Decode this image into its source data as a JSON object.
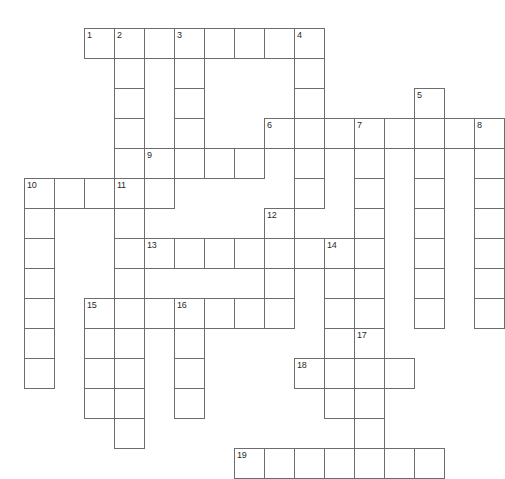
{
  "puzzle": {
    "kind": "crossword-grid",
    "title": "",
    "columns": 16,
    "rows": 15,
    "cell_size_px": 30,
    "origin_x_px": 24,
    "origin_y_px": 28,
    "cell_fill_color": "#ffffff",
    "cell_border_color": "#6d6d6d",
    "number_color": "#2a2a2a",
    "background_color": "#ffffff",
    "total_cells": 128,
    "total_numbers": 19,
    "entries_across": [
      {
        "number": "1",
        "row": 0,
        "col": 2,
        "length": 8
      },
      {
        "number": "6",
        "row": 3,
        "col": 8,
        "length": 7
      },
      {
        "number": "9",
        "row": 4,
        "col": 4,
        "length": 4
      },
      {
        "number": "10",
        "row": 5,
        "col": 0,
        "length": 5
      },
      {
        "number": "13",
        "row": 7,
        "col": 4,
        "length": 6
      },
      {
        "number": "15",
        "row": 9,
        "col": 2,
        "length": 6
      },
      {
        "number": "18",
        "row": 11,
        "col": 9,
        "length": 4
      },
      {
        "number": "19",
        "row": 14,
        "col": 7,
        "length": 7
      }
    ],
    "entries_down": [
      {
        "number": "2",
        "row": 0,
        "col": 3,
        "length": 5
      },
      {
        "number": "3",
        "row": 0,
        "col": 5,
        "length": 5
      },
      {
        "number": "4",
        "row": 0,
        "col": 9,
        "length": 7
      },
      {
        "number": "5",
        "row": 2,
        "col": 13,
        "length": 7
      },
      {
        "number": "7",
        "row": 3,
        "col": 11,
        "length": 8
      },
      {
        "number": "8",
        "row": 3,
        "col": 15,
        "length": 6
      },
      {
        "number": "10",
        "row": 5,
        "col": 0,
        "length": 7
      },
      {
        "number": "11",
        "row": 5,
        "col": 3,
        "length": 8
      },
      {
        "number": "12",
        "row": 6,
        "col": 8,
        "length": 6
      },
      {
        "number": "14",
        "row": 7,
        "col": 10,
        "length": 7
      },
      {
        "number": "16",
        "row": 9,
        "col": 5,
        "length": 4
      },
      {
        "number": "17",
        "row": 10,
        "col": 11,
        "length": 6
      }
    ],
    "cells": [
      [
        0,
        2
      ],
      [
        0,
        3
      ],
      [
        0,
        4
      ],
      [
        0,
        5
      ],
      [
        0,
        6
      ],
      [
        0,
        7
      ],
      [
        0,
        8
      ],
      [
        0,
        9
      ],
      [
        1,
        3
      ],
      [
        1,
        5
      ],
      [
        1,
        9
      ],
      [
        2,
        3
      ],
      [
        2,
        5
      ],
      [
        2,
        9
      ],
      [
        2,
        13
      ],
      [
        3,
        3
      ],
      [
        3,
        5
      ],
      [
        3,
        8
      ],
      [
        3,
        9
      ],
      [
        3,
        10
      ],
      [
        3,
        11
      ],
      [
        3,
        12
      ],
      [
        3,
        13
      ],
      [
        3,
        14
      ],
      [
        3,
        15
      ],
      [
        4,
        3
      ],
      [
        4,
        4
      ],
      [
        4,
        5
      ],
      [
        4,
        6
      ],
      [
        4,
        7
      ],
      [
        4,
        9
      ],
      [
        4,
        11
      ],
      [
        4,
        13
      ],
      [
        4,
        15
      ],
      [
        5,
        0
      ],
      [
        5,
        1
      ],
      [
        5,
        2
      ],
      [
        5,
        3
      ],
      [
        5,
        4
      ],
      [
        5,
        9
      ],
      [
        5,
        11
      ],
      [
        5,
        13
      ],
      [
        5,
        15
      ],
      [
        6,
        0
      ],
      [
        6,
        3
      ],
      [
        6,
        8
      ],
      [
        6,
        11
      ],
      [
        6,
        13
      ],
      [
        6,
        15
      ],
      [
        7,
        0
      ],
      [
        7,
        3
      ],
      [
        7,
        4
      ],
      [
        7,
        5
      ],
      [
        7,
        6
      ],
      [
        7,
        7
      ],
      [
        7,
        8
      ],
      [
        7,
        9
      ],
      [
        7,
        10
      ],
      [
        7,
        11
      ],
      [
        7,
        13
      ],
      [
        7,
        15
      ],
      [
        8,
        0
      ],
      [
        8,
        3
      ],
      [
        8,
        8
      ],
      [
        8,
        10
      ],
      [
        8,
        11
      ],
      [
        8,
        13
      ],
      [
        8,
        15
      ],
      [
        9,
        0
      ],
      [
        9,
        2
      ],
      [
        9,
        3
      ],
      [
        9,
        4
      ],
      [
        9,
        5
      ],
      [
        9,
        6
      ],
      [
        9,
        7
      ],
      [
        9,
        8
      ],
      [
        9,
        10
      ],
      [
        9,
        11
      ],
      [
        9,
        13
      ],
      [
        9,
        15
      ],
      [
        10,
        0
      ],
      [
        10,
        2
      ],
      [
        10,
        3
      ],
      [
        10,
        5
      ],
      [
        10,
        10
      ],
      [
        10,
        11
      ],
      [
        11,
        0
      ],
      [
        11,
        2
      ],
      [
        11,
        3
      ],
      [
        11,
        5
      ],
      [
        11,
        9
      ],
      [
        11,
        10
      ],
      [
        11,
        11
      ],
      [
        11,
        12
      ],
      [
        12,
        2
      ],
      [
        12,
        3
      ],
      [
        12,
        5
      ],
      [
        12,
        10
      ],
      [
        12,
        11
      ],
      [
        13,
        3
      ],
      [
        13,
        11
      ],
      [
        14,
        7
      ],
      [
        14,
        8
      ],
      [
        14,
        9
      ],
      [
        14,
        10
      ],
      [
        14,
        11
      ],
      [
        14,
        12
      ],
      [
        14,
        13
      ]
    ],
    "numbered_cells": [
      {
        "label": "1",
        "row": 0,
        "col": 2
      },
      {
        "label": "2",
        "row": 0,
        "col": 3
      },
      {
        "label": "3",
        "row": 0,
        "col": 5
      },
      {
        "label": "4",
        "row": 0,
        "col": 9
      },
      {
        "label": "5",
        "row": 2,
        "col": 13
      },
      {
        "label": "6",
        "row": 3,
        "col": 8
      },
      {
        "label": "7",
        "row": 3,
        "col": 11
      },
      {
        "label": "8",
        "row": 3,
        "col": 15
      },
      {
        "label": "9",
        "row": 4,
        "col": 4
      },
      {
        "label": "10",
        "row": 5,
        "col": 0
      },
      {
        "label": "11",
        "row": 5,
        "col": 3
      },
      {
        "label": "12",
        "row": 6,
        "col": 8
      },
      {
        "label": "13",
        "row": 7,
        "col": 4
      },
      {
        "label": "14",
        "row": 7,
        "col": 10
      },
      {
        "label": "15",
        "row": 9,
        "col": 2
      },
      {
        "label": "16",
        "row": 9,
        "col": 5
      },
      {
        "label": "17",
        "row": 10,
        "col": 11
      },
      {
        "label": "18",
        "row": 11,
        "col": 9
      },
      {
        "label": "19",
        "row": 14,
        "col": 7
      }
    ],
    "letters": []
  }
}
